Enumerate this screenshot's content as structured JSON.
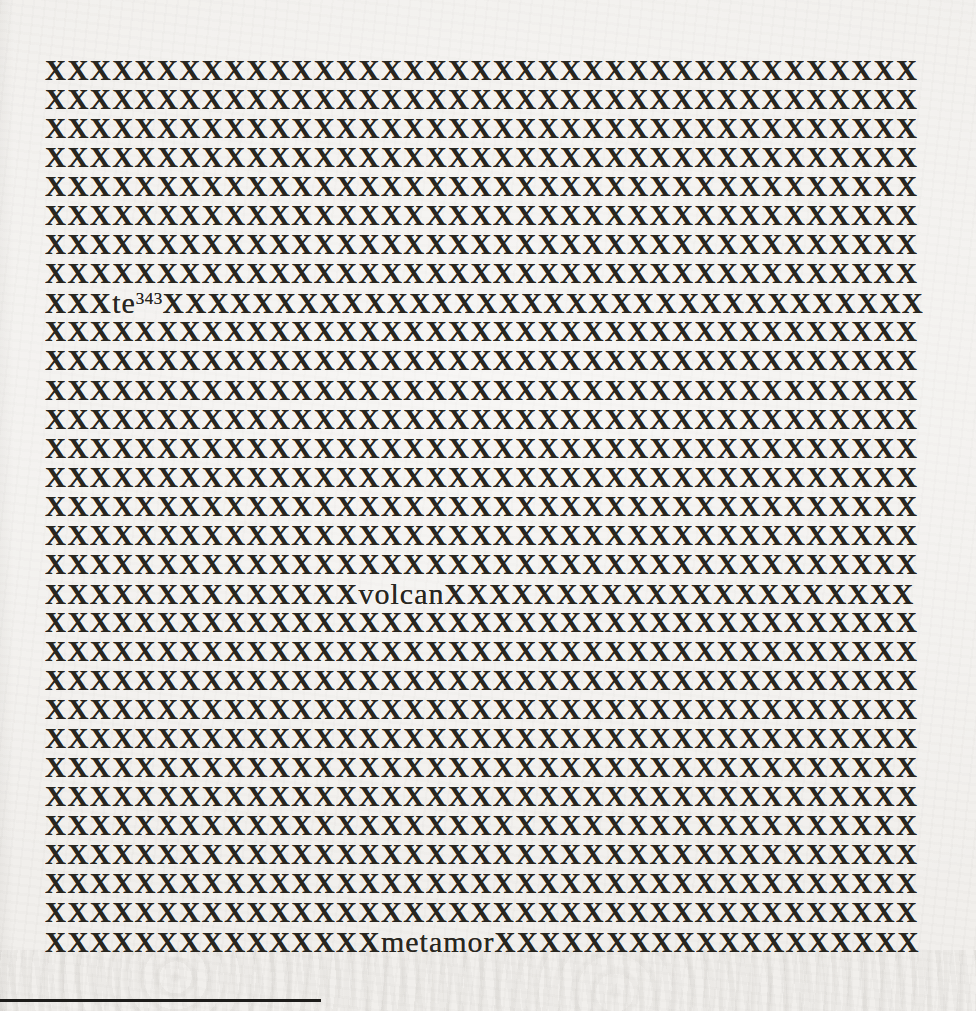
{
  "document": {
    "paper_color": "#f1efec",
    "ink_color": "#28261f",
    "x_full_line": "XXXXXXXXXXXXXXXXXXXXXXXXXXXXXXXXXXXXXXX",
    "visible_words": {
      "footnoted_fragment": "te",
      "footnote_reference": "343",
      "fragment_2": "volcan",
      "fragment_3": "metamor"
    },
    "lines": [
      {
        "kind": "full"
      },
      {
        "kind": "full"
      },
      {
        "kind": "full"
      },
      {
        "kind": "full"
      },
      {
        "kind": "full"
      },
      {
        "kind": "full"
      },
      {
        "kind": "full"
      },
      {
        "kind": "full"
      },
      {
        "kind": "segments",
        "segments": [
          {
            "style": "x",
            "text": "XXX"
          },
          {
            "style": "word",
            "text": "te"
          },
          {
            "style": "sup",
            "text": "343"
          },
          {
            "style": "x",
            "text": "XXXXXXXXXXXXXXXXXXXXXXXXXXXXXXXXXX"
          }
        ]
      },
      {
        "kind": "full"
      },
      {
        "kind": "full"
      },
      {
        "kind": "full"
      },
      {
        "kind": "full"
      },
      {
        "kind": "full"
      },
      {
        "kind": "full"
      },
      {
        "kind": "full"
      },
      {
        "kind": "full"
      },
      {
        "kind": "full"
      },
      {
        "kind": "segments",
        "segments": [
          {
            "style": "x",
            "text": "XXXXXXXXXXXXXX"
          },
          {
            "style": "word",
            "text": "volcan"
          },
          {
            "style": "x",
            "text": "XXXXXXXXXXXXXXXXXXXXX"
          }
        ]
      },
      {
        "kind": "full"
      },
      {
        "kind": "full"
      },
      {
        "kind": "full"
      },
      {
        "kind": "full"
      },
      {
        "kind": "full"
      },
      {
        "kind": "full"
      },
      {
        "kind": "full"
      },
      {
        "kind": "full"
      },
      {
        "kind": "full"
      },
      {
        "kind": "full"
      },
      {
        "kind": "full"
      },
      {
        "kind": "segments",
        "segments": [
          {
            "style": "x",
            "text": "XXXXXXXXXXXXXXX"
          },
          {
            "style": "word",
            "text": "metamor"
          },
          {
            "style": "x",
            "text": "XXXXXXXXXXXXXXXXXXX"
          }
        ]
      }
    ],
    "footnote_rule": {
      "present": true
    }
  }
}
